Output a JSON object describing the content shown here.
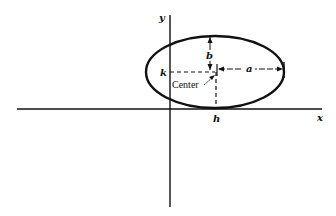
{
  "diagram": {
    "axes": {
      "x_label": "x",
      "y_label": "y"
    },
    "labels": {
      "h": "h",
      "k": "k",
      "a": "a",
      "b": "b",
      "center": "Center"
    },
    "ellipse": {
      "cx": 215,
      "cy": 72,
      "rx": 69,
      "ry": 36
    }
  }
}
